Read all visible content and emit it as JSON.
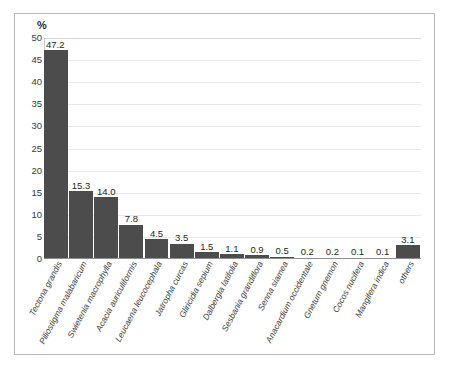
{
  "chart_data": {
    "type": "bar",
    "title": "",
    "subtitle": "",
    "xlabel": "",
    "ylabel": "%",
    "ylim": [
      0,
      50
    ],
    "ytick_step": 5,
    "yticks": [
      "50",
      "45",
      "40",
      "35",
      "30",
      "25",
      "20",
      "15",
      "10",
      "5",
      "0"
    ],
    "grid": true,
    "legend": "none",
    "bar_color": "#4c4c4c",
    "categories": [
      "Tectona grandis",
      "Piliostigma malabaricum",
      "Swietenia macrophylla",
      "Acacia auriculiformis",
      "Leucaena leucocephala",
      "Jatropha curcas",
      "Gliricidia sepium",
      "Dalbergia latifolia",
      "Sesbania grandiflora",
      "Senna siamea",
      "Anacardium occidentale",
      "Gnetum gnemon",
      "Cocos nucifera",
      "Mangifera indica",
      "others"
    ],
    "values": [
      47.2,
      15.3,
      14.0,
      7.8,
      4.5,
      3.5,
      1.5,
      1.1,
      0.9,
      0.5,
      0.2,
      0.2,
      0.1,
      0.1,
      3.1
    ],
    "value_labels": [
      "47.2",
      "15.3",
      "14.0",
      "7.8",
      "4.5",
      "3.5",
      "1.5",
      "1.1",
      "0.9",
      "0.5",
      "0.2",
      "0.2",
      "0.1",
      "0.1",
      "3.1"
    ]
  }
}
